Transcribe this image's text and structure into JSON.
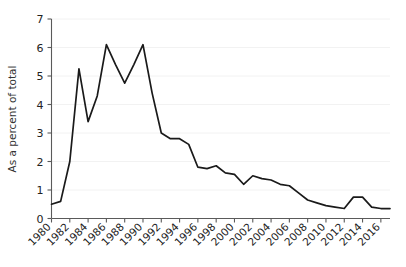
{
  "chart_data": {
    "type": "line",
    "title": "",
    "subtitle": "",
    "xlabel": "",
    "ylabel": "As a percent of total",
    "xlim": [
      1980,
      2017
    ],
    "ylim": [
      0,
      7
    ],
    "grid": true,
    "legend": false,
    "legend_position": "none",
    "line_color": "#1a1a1a",
    "y_ticks": [
      0,
      1,
      2,
      3,
      4,
      5,
      6,
      7
    ],
    "y_tick_labels": [
      "0",
      "1",
      "2",
      "3",
      "4",
      "5",
      "6",
      "7"
    ],
    "x_ticks": [
      1980,
      1982,
      1984,
      1986,
      1988,
      1990,
      1992,
      1994,
      1996,
      1998,
      2000,
      2002,
      2004,
      2006,
      2008,
      2010,
      2012,
      2014,
      2016
    ],
    "x_tick_labels": [
      "1980",
      "1982",
      "1984",
      "1986",
      "1988",
      "1990",
      "1992",
      "1994",
      "1996",
      "1998",
      "2000",
      "2002",
      "2004",
      "2006",
      "2008",
      "2010",
      "2012",
      "2014",
      "2016"
    ],
    "x": [
      1980,
      1981,
      1982,
      1983,
      1984,
      1985,
      1986,
      1987,
      1988,
      1989,
      1990,
      1991,
      1992,
      1993,
      1994,
      1995,
      1996,
      1997,
      1998,
      1999,
      2000,
      2001,
      2002,
      2003,
      2004,
      2005,
      2006,
      2007,
      2008,
      2009,
      2010,
      2011,
      2012,
      2013,
      2014,
      2015,
      2016,
      2017
    ],
    "values": [
      0.5,
      0.6,
      2.0,
      5.25,
      3.4,
      4.3,
      6.1,
      5.4,
      4.75,
      5.4,
      6.1,
      4.4,
      3.0,
      2.8,
      2.8,
      2.6,
      1.8,
      1.75,
      1.85,
      1.6,
      1.55,
      1.2,
      1.5,
      1.4,
      1.35,
      1.2,
      1.15,
      0.9,
      0.65,
      0.55,
      0.45,
      0.4,
      0.35,
      0.75,
      0.75,
      0.4,
      0.35,
      0.35
    ],
    "series": [
      {
        "name": "As a percent of total",
        "values": [
          0.5,
          0.6,
          2.0,
          5.25,
          3.4,
          4.3,
          6.1,
          5.4,
          4.75,
          5.4,
          6.1,
          4.4,
          3.0,
          2.8,
          2.8,
          2.6,
          1.8,
          1.75,
          1.85,
          1.6,
          1.55,
          1.2,
          1.5,
          1.4,
          1.35,
          1.2,
          1.15,
          0.9,
          0.65,
          0.55,
          0.45,
          0.4,
          0.35,
          0.75,
          0.75,
          0.4,
          0.35,
          0.35
        ]
      }
    ],
    "annotations": []
  }
}
